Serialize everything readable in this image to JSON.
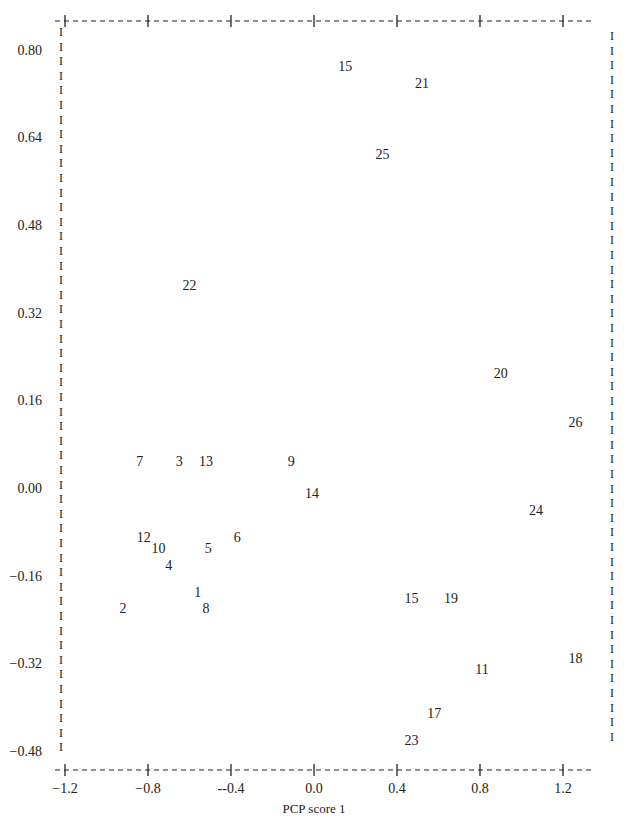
{
  "chart_data": {
    "type": "scatter",
    "title": "",
    "xlabel": "PCP score 1",
    "ylabel": "",
    "xlim": [
      -1.2,
      1.35
    ],
    "ylim": [
      -0.48,
      0.82
    ],
    "grid": false,
    "legend": null,
    "x_ticks": [
      "-1.2",
      "-0.8",
      "--0.4",
      "0.0",
      "0.4",
      "0.8",
      "1.2"
    ],
    "x_tick_values": [
      -1.2,
      -0.8,
      -0.4,
      0.0,
      0.4,
      0.8,
      1.2
    ],
    "y_ticks": [
      "0.80",
      "0.64",
      "0.48",
      "0.32",
      "0.16",
      "0.00",
      "-0.16",
      "-0.32",
      "-0.48"
    ],
    "y_tick_values": [
      0.8,
      0.64,
      0.48,
      0.32,
      0.16,
      0.0,
      -0.16,
      -0.32,
      -0.48
    ],
    "marker": "numeric-label",
    "points": [
      {
        "label": "15",
        "x": 0.15,
        "y": 0.77
      },
      {
        "label": "21",
        "x": 0.52,
        "y": 0.74
      },
      {
        "label": "25",
        "x": 0.33,
        "y": 0.61
      },
      {
        "label": "22",
        "x": -0.6,
        "y": 0.37
      },
      {
        "label": "20",
        "x": 0.9,
        "y": 0.21
      },
      {
        "label": "26",
        "x": 1.26,
        "y": 0.12
      },
      {
        "label": "7",
        "x": -0.84,
        "y": 0.05
      },
      {
        "label": "3",
        "x": -0.65,
        "y": 0.05
      },
      {
        "label": "13",
        "x": -0.52,
        "y": 0.05
      },
      {
        "label": "9",
        "x": -0.11,
        "y": 0.05
      },
      {
        "label": "14",
        "x": -0.01,
        "y": -0.01
      },
      {
        "label": "24",
        "x": 1.07,
        "y": -0.04
      },
      {
        "label": "12",
        "x": -0.82,
        "y": -0.09
      },
      {
        "label": "6",
        "x": -0.37,
        "y": -0.09
      },
      {
        "label": "10",
        "x": -0.75,
        "y": -0.11
      },
      {
        "label": "5",
        "x": -0.51,
        "y": -0.11
      },
      {
        "label": "4",
        "x": -0.7,
        "y": -0.14
      },
      {
        "label": "1",
        "x": -0.56,
        "y": -0.19
      },
      {
        "label": "15",
        "x": 0.47,
        "y": -0.2
      },
      {
        "label": "19",
        "x": 0.66,
        "y": -0.2
      },
      {
        "label": "2",
        "x": -0.92,
        "y": -0.22
      },
      {
        "label": "8",
        "x": -0.52,
        "y": -0.22
      },
      {
        "label": "18",
        "x": 1.26,
        "y": -0.31
      },
      {
        "label": "11",
        "x": 0.81,
        "y": -0.33
      },
      {
        "label": "17",
        "x": 0.58,
        "y": -0.41
      },
      {
        "label": "23",
        "x": 0.47,
        "y": -0.46
      }
    ]
  }
}
